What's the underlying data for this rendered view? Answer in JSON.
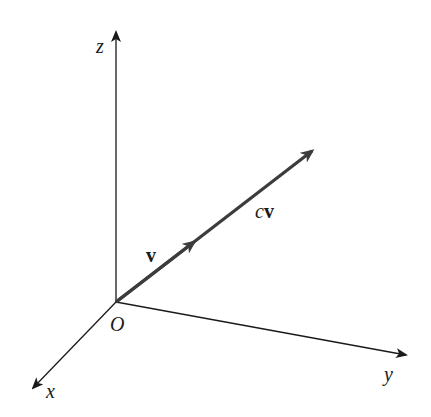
{
  "diagram": {
    "type": "3d-vector-scalar-multiple",
    "colors": {
      "axis": "#1a1a1a",
      "vector": "#3c3c3c",
      "background": "#ffffff"
    },
    "origin": {
      "label": "O",
      "x": 116,
      "y": 302
    },
    "axes": [
      {
        "name": "z",
        "label": "z",
        "x2": 116,
        "y2": 30
      },
      {
        "name": "x",
        "label": "x",
        "x2": 32,
        "y2": 389
      },
      {
        "name": "y",
        "label": "y",
        "x2": 408,
        "y2": 355
      }
    ],
    "vectors": [
      {
        "name": "v",
        "label": "v",
        "x2": 196,
        "y2": 240
      },
      {
        "name": "cv",
        "label_c": "c",
        "label_v": "v",
        "x2": 314,
        "y2": 150
      }
    ]
  }
}
